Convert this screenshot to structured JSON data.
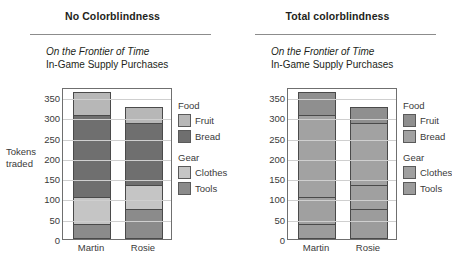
{
  "panels": [
    {
      "header": "No Colorblindness",
      "title_line1": "On the Frontier of Time",
      "title_line2": "In-Game Supply Purchases",
      "colors": {
        "Fruit": "#b7b7b7",
        "Bread": "#6f6f6f",
        "Clothes": "#c5c5c5",
        "Tools": "#8b8b8b"
      }
    },
    {
      "header": "Total colorblindness",
      "title_line1": "On the Frontier of Time",
      "title_line2": "In-Game Supply Purchases",
      "colors": {
        "Fruit": "#8f8f8f",
        "Bread": "#a2a2a2",
        "Clothes": "#a0a0a0",
        "Tools": "#9c9c9c"
      }
    }
  ],
  "legend": {
    "groups": [
      {
        "title": "Food",
        "items": [
          "Fruit",
          "Bread"
        ]
      },
      {
        "title": "Gear",
        "items": [
          "Clothes",
          "Tools"
        ]
      }
    ]
  },
  "chart_data": {
    "type": "bar",
    "subtype": "stacked",
    "title": "On the Frontier of Time",
    "subtitle": "In-Game Supply Purchases",
    "xlabel": "",
    "ylabel": "Tokens traded",
    "ylim": [
      0,
      375
    ],
    "yticks": [
      0,
      50,
      100,
      150,
      200,
      250,
      300,
      350
    ],
    "grid": true,
    "legend_position": "right",
    "categories": [
      "Martin",
      "Rosie"
    ],
    "stack_order": [
      "Tools",
      "Clothes",
      "Bread",
      "Fruit"
    ],
    "series": [
      {
        "name": "Tools",
        "values": [
          38,
          75
        ]
      },
      {
        "name": "Clothes",
        "values": [
          66,
          58
        ]
      },
      {
        "name": "Bread",
        "values": [
          201,
          152
        ]
      },
      {
        "name": "Fruit",
        "values": [
          57,
          40
        ]
      }
    ],
    "cumulative_tops": {
      "Martin": {
        "Tools": 38,
        "Clothes": 104,
        "Bread": 305,
        "Fruit": 362
      },
      "Rosie": {
        "Tools": 75,
        "Clothes": 133,
        "Bread": 285,
        "Fruit": 325
      }
    },
    "totals": {
      "Martin": 362,
      "Rosie": 325
    }
  }
}
